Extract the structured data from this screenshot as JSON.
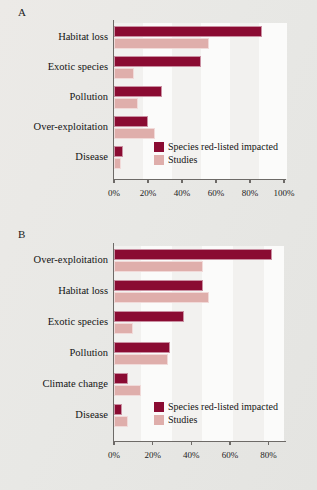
{
  "figure": {
    "background_color": "#e9e9e6",
    "series_colors": {
      "dark": "#8a0b32",
      "light": "#dfaeab"
    }
  },
  "panels": [
    {
      "letter": "A",
      "legend": [
        {
          "key": "dark",
          "label": "Species red-listed impacted"
        },
        {
          "key": "light",
          "label": "Studies"
        }
      ],
      "ticks": [
        "0%",
        "20%",
        "40%",
        "60%",
        "80%",
        "100%"
      ]
    },
    {
      "letter": "B",
      "legend": [
        {
          "key": "dark",
          "label": "Species red-listed impacted"
        },
        {
          "key": "light",
          "label": "Studies"
        }
      ],
      "ticks": [
        "0%",
        "20%",
        "40%",
        "60%",
        "80%"
      ]
    }
  ],
  "chart_data": [
    {
      "type": "bar",
      "panel": "A",
      "orientation": "horizontal",
      "title": "",
      "xlabel": "",
      "ylabel": "",
      "xlim": [
        0,
        100
      ],
      "xticks": [
        0,
        20,
        40,
        60,
        80,
        100
      ],
      "xtick_labels": [
        "0%",
        "20%",
        "40%",
        "60%",
        "80%",
        "100%"
      ],
      "grid": false,
      "legend_position": "inside-bottom-right",
      "categories": [
        "Habitat loss",
        "Exotic species",
        "Pollution",
        "Over-exploitation",
        "Disease"
      ],
      "series": [
        {
          "name": "Species red-listed impacted",
          "color": "#8a0b32",
          "values": [
            87,
            51,
            28,
            20,
            5
          ]
        },
        {
          "name": "Studies",
          "color": "#dfaeab",
          "values": [
            56,
            12,
            14,
            24,
            4
          ]
        }
      ]
    },
    {
      "type": "bar",
      "panel": "B",
      "orientation": "horizontal",
      "title": "",
      "xlabel": "",
      "ylabel": "",
      "xlim": [
        0,
        88
      ],
      "xticks": [
        0,
        20,
        40,
        60,
        80
      ],
      "xtick_labels": [
        "0%",
        "20%",
        "40%",
        "60%",
        "80%"
      ],
      "grid": false,
      "legend_position": "inside-bottom-right",
      "categories": [
        "Over-exploitation",
        "Habitat loss",
        "Exotic species",
        "Pollution",
        "Climate change",
        "Disease"
      ],
      "series": [
        {
          "name": "Species red-listed impacted",
          "color": "#8a0b32",
          "values": [
            82,
            46,
            36,
            29,
            7,
            4
          ]
        },
        {
          "name": "Studies",
          "color": "#dfaeab",
          "values": [
            46,
            49,
            10,
            28,
            14,
            7
          ]
        }
      ]
    }
  ]
}
